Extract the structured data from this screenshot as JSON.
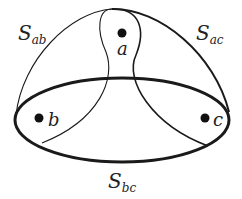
{
  "diagram": {
    "points": [
      {
        "id": "a",
        "label": "a",
        "x": 121,
        "y": 33
      },
      {
        "id": "b",
        "label": "b",
        "x": 39,
        "y": 118
      },
      {
        "id": "c",
        "label": "c",
        "x": 204,
        "y": 118
      }
    ],
    "sets": [
      {
        "id": "S_ab",
        "main": "S",
        "sub": "ab",
        "stroke_width": 1.2
      },
      {
        "id": "S_ac",
        "main": "S",
        "sub": "ac",
        "stroke_width": 2.0
      },
      {
        "id": "S_bc",
        "main": "S",
        "sub": "bc",
        "stroke_width": 3.0
      }
    ],
    "colors": {
      "stroke": "#1a1a1a",
      "background": "#ffffff"
    }
  }
}
